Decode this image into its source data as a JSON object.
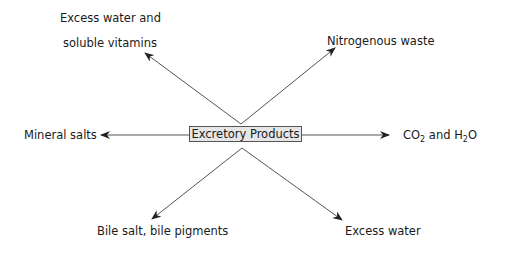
{
  "center": {
    "label": "Excretory Products"
  },
  "outputs": {
    "upper_left": {
      "line1": "Excess water and",
      "line2": "soluble vitamins"
    },
    "upper_right": {
      "label": "Nitrogenous waste"
    },
    "left": {
      "label": "Mineral salts"
    },
    "right": {
      "co": "CO",
      "sub1": "2",
      "and": " and H",
      "sub2": "2",
      "o": "O"
    },
    "lower_left": {
      "label": "Bile salt, bile pigments"
    },
    "lower_right": {
      "label": "Excess water"
    }
  },
  "colors": {
    "line": "#555555",
    "box_fill": "#e6e6e6",
    "text": "#1a1a1a"
  }
}
